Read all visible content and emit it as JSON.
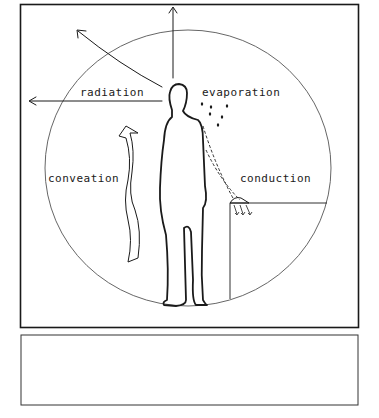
{
  "diagram": {
    "title": "",
    "labels": {
      "radiation": "radiation",
      "evaporation": "evaporation",
      "convection": "conveation",
      "conduction": "conduction"
    },
    "colors": {
      "ink": "#1a1a1a",
      "circle": "#555555",
      "background": "#ffffff"
    },
    "caption_box": {
      "text": ""
    }
  }
}
